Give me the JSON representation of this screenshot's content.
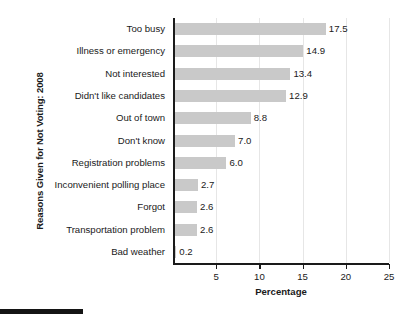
{
  "chart_data": {
    "type": "bar",
    "orientation": "horizontal",
    "title": "",
    "xlabel": "Percentage",
    "ylabel": "Reasons Given for Not Voting: 2008",
    "categories": [
      "Too busy",
      "Illness or emergency",
      "Not interested",
      "Didn't like candidates",
      "Out of town",
      "Don't know",
      "Registration problems",
      "Inconvenient polling place",
      "Forgot",
      "Transportation problem",
      "Bad weather"
    ],
    "values": [
      17.5,
      14.9,
      13.4,
      12.9,
      8.8,
      7.0,
      6.0,
      2.7,
      2.6,
      2.6,
      0.2
    ],
    "value_labels": [
      "17.5",
      "14.9",
      "13.4",
      "12.9",
      "8.8",
      "7.0",
      "6.0",
      "2.7",
      "2.6",
      "2.6",
      "0.2"
    ],
    "xlim": [
      0,
      25
    ],
    "xticks": [
      5,
      10,
      15,
      20,
      25
    ],
    "xtick_labels": [
      "5",
      "10",
      "15",
      "20",
      "25"
    ],
    "grid": "vertical-light",
    "legend": "none",
    "bar_color": "#c9c9c9",
    "axis_color": "#1a1a1a",
    "gridline_color": "#e6e6e6"
  },
  "footer": {
    "rule_color": "#141414"
  }
}
